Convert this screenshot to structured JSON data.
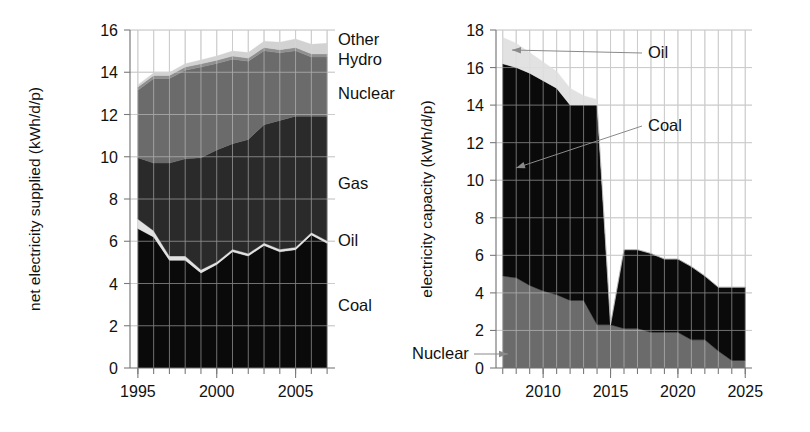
{
  "figure": {
    "background": "#ffffff",
    "panels": [
      "left-chart",
      "right-chart"
    ]
  },
  "colors": {
    "coal": "#0a0a0a",
    "oil": "#e2e2e2",
    "gas": "#2a2a2a",
    "nuclear": "#6b6b6b",
    "hydro": "#8f8f8f",
    "other": "#d2d2d2",
    "nuclear_capacity": "#6b6b6b",
    "gridline": "#b9b9b9",
    "axis": "#6f6f6f",
    "text": "#111111"
  },
  "chart_data": [
    {
      "id": "left-chart",
      "type": "area",
      "title": "",
      "xlabel": "",
      "ylabel": "net electricity supplied (kWh/d/p)",
      "xlim": [
        1994.5,
        2007.5
      ],
      "ylim": [
        0,
        16
      ],
      "yticks": [
        0,
        2,
        4,
        6,
        8,
        10,
        12,
        14,
        16
      ],
      "xticks": [
        1995,
        2000,
        2005
      ],
      "xtick_labels": [
        "1995",
        "2000",
        "2005"
      ],
      "xminor": [
        1995,
        1996,
        1997,
        1998,
        1999,
        2000,
        2001,
        2002,
        2003,
        2004,
        2005,
        2006,
        2007
      ],
      "grid": true,
      "legend_position": "right-inline",
      "x": [
        1995,
        1996,
        1997,
        1998,
        1999,
        2000,
        2001,
        2002,
        2003,
        2004,
        2005,
        2006,
        2007
      ],
      "series": [
        {
          "name": "Coal",
          "color": "#0a0a0a",
          "values": [
            6.6,
            6.2,
            5.1,
            5.1,
            4.5,
            4.9,
            5.5,
            5.3,
            5.8,
            5.5,
            5.6,
            6.3,
            5.9
          ]
        },
        {
          "name": "Oil",
          "color": "#e2e2e2",
          "values": [
            0.45,
            0.3,
            0.2,
            0.2,
            0.15,
            0.12,
            0.12,
            0.12,
            0.12,
            0.12,
            0.12,
            0.12,
            0.12
          ]
        },
        {
          "name": "Gas",
          "color": "#2a2a2a",
          "values": [
            2.9,
            3.2,
            4.4,
            4.6,
            5.3,
            5.3,
            5.0,
            5.4,
            5.6,
            6.1,
            6.2,
            5.5,
            5.9
          ]
        },
        {
          "name": "Nuclear",
          "color": "#6b6b6b",
          "values": [
            3.2,
            4.0,
            4.0,
            4.2,
            4.3,
            4.1,
            4.0,
            3.7,
            3.5,
            3.2,
            3.1,
            2.8,
            2.8
          ]
        },
        {
          "name": "Hydro",
          "color": "#8f8f8f",
          "values": [
            0.15,
            0.15,
            0.15,
            0.15,
            0.15,
            0.15,
            0.15,
            0.15,
            0.15,
            0.15,
            0.15,
            0.15,
            0.15
          ]
        },
        {
          "name": "Other",
          "color": "#d2d2d2",
          "values": [
            0.1,
            0.12,
            0.14,
            0.15,
            0.18,
            0.2,
            0.23,
            0.26,
            0.3,
            0.35,
            0.4,
            0.45,
            0.5
          ]
        }
      ],
      "labels": [
        {
          "text": "Other",
          "x": 338,
          "y": 45
        },
        {
          "text": "Hydro",
          "x": 338,
          "y": 65
        },
        {
          "text": "Nuclear",
          "x": 338,
          "y": 99
        },
        {
          "text": "Gas",
          "x": 338,
          "y": 189
        },
        {
          "text": "Oil",
          "x": 338,
          "y": 246
        },
        {
          "text": "Coal",
          "x": 338,
          "y": 311
        }
      ]
    },
    {
      "id": "right-chart",
      "type": "area",
      "title": "",
      "xlabel": "",
      "ylabel": "electricity capacity (kWh/d/p)",
      "xlim": [
        2006.5,
        2025.5
      ],
      "ylim": [
        0,
        18
      ],
      "yticks": [
        0,
        2,
        4,
        6,
        8,
        10,
        12,
        14,
        16,
        18
      ],
      "xticks": [
        2010,
        2015,
        2020,
        2025
      ],
      "xtick_labels": [
        "2010",
        "2015",
        "2020",
        "2025"
      ],
      "xminor": [
        2007,
        2008,
        2009,
        2010,
        2011,
        2012,
        2013,
        2014,
        2015,
        2016,
        2017,
        2018,
        2019,
        2020,
        2021,
        2022,
        2023,
        2024,
        2025
      ],
      "grid": true,
      "legend_position": "inline-annotated",
      "x": [
        2007,
        2008,
        2009,
        2010,
        2011,
        2012,
        2013,
        2014,
        2015,
        2016,
        2017,
        2018,
        2019,
        2020,
        2021,
        2022,
        2023,
        2024,
        2025
      ],
      "series": [
        {
          "name": "Nuclear",
          "color": "#6b6b6b",
          "values": [
            4.9,
            4.8,
            4.4,
            4.1,
            3.9,
            3.6,
            3.6,
            2.3,
            2.3,
            2.1,
            2.1,
            1.9,
            1.9,
            1.9,
            1.5,
            1.5,
            0.9,
            0.4,
            0.4
          ]
        },
        {
          "name": "Coal",
          "color": "#0a0a0a",
          "values": [
            11.3,
            11.2,
            11.3,
            11.2,
            11.0,
            10.4,
            10.4,
            11.7,
            0.0,
            4.2,
            4.2,
            4.2,
            3.9,
            3.9,
            3.9,
            3.4,
            3.4,
            3.9,
            3.9
          ]
        },
        {
          "name": "Oil",
          "color": "#e2e2e2",
          "values": [
            1.4,
            1.3,
            1.1,
            1.0,
            0.9,
            0.9,
            0.5,
            0.3,
            0.0,
            0.0,
            0.0,
            0.0,
            0.0,
            0.0,
            0.0,
            0.0,
            0.0,
            0.0,
            0.0
          ]
        }
      ],
      "annotations": [
        {
          "text": "Oil",
          "x": 648,
          "y": 58,
          "arrow_to_x": 512,
          "arrow_to_y": 50
        },
        {
          "text": "Coal",
          "x": 648,
          "y": 131,
          "arrow_to_x": 516,
          "arrow_to_y": 168
        },
        {
          "text": "Nuclear",
          "x": 412,
          "y": 359,
          "arrow_to_x": 508,
          "arrow_to_y": 354
        }
      ]
    }
  ]
}
